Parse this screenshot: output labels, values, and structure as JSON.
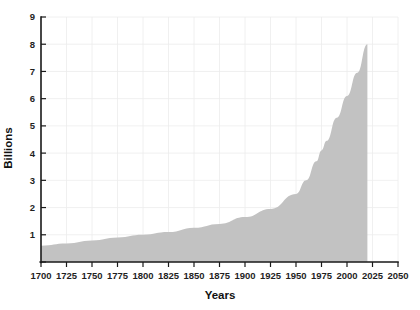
{
  "chart_data": {
    "type": "area",
    "title": "",
    "xlabel": "Years",
    "ylabel": "Billions",
    "xlim": [
      1700,
      2050
    ],
    "ylim": [
      0,
      9
    ],
    "grid": true,
    "legend": null,
    "x_ticks": [
      1700,
      1725,
      1750,
      1775,
      1800,
      1825,
      1850,
      1875,
      1900,
      1925,
      1950,
      1975,
      2000,
      2025,
      2050
    ],
    "y_ticks": [
      0,
      1,
      2,
      3,
      4,
      5,
      6,
      7,
      8,
      9
    ],
    "y_tick_labels": [
      "",
      "1",
      "2",
      "3",
      "4",
      "5",
      "6",
      "7",
      "8",
      "9"
    ],
    "series": [
      {
        "name": "World population",
        "fill_color": "#c2c2c2",
        "x": [
          1700,
          1725,
          1750,
          1775,
          1800,
          1825,
          1850,
          1875,
          1900,
          1925,
          1950,
          1960,
          1970,
          1975,
          1980,
          1990,
          2000,
          2010,
          2020
        ],
        "values": [
          0.6,
          0.68,
          0.79,
          0.9,
          1.0,
          1.1,
          1.26,
          1.4,
          1.65,
          1.95,
          2.5,
          3.0,
          3.7,
          4.1,
          4.45,
          5.3,
          6.1,
          6.95,
          8.0
        ]
      }
    ]
  },
  "axis": {
    "y_label": "Billions",
    "x_label": "Years"
  },
  "colors": {
    "area": "#c2c2c2",
    "axis": "#1a1a1a",
    "grid": "#ececec",
    "background": "#ffffff"
  }
}
